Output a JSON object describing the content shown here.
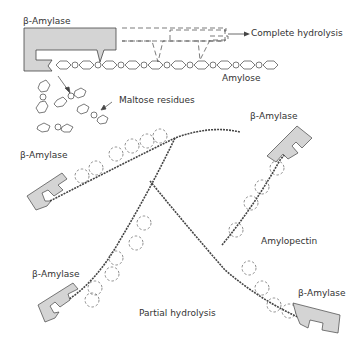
{
  "diagram": {
    "labels": {
      "enzyme_top": "β-Amylase",
      "complete_hydrolysis": "Complete hydrolysis",
      "amylose": "Amylose",
      "maltose_residues": "Maltose residues",
      "enzyme_left": "β-Amylase",
      "enzyme_right_top": "β-Amylase",
      "amylopectin": "Amylopectin",
      "enzyme_bottom_left": "β-Amylase",
      "partial_hydrolysis": "Partial hydrolysis",
      "enzyme_bottom_right": "β-Amylase"
    },
    "colors": {
      "enzyme_fill": "#d4d4d4",
      "stroke": "#444444",
      "text": "#333333"
    }
  }
}
